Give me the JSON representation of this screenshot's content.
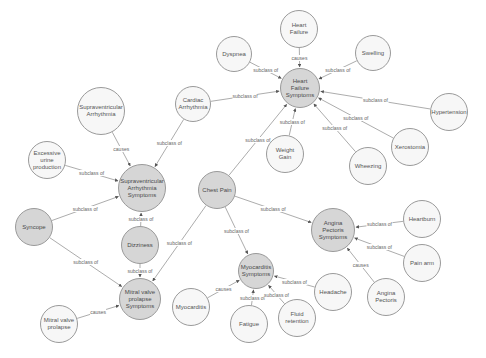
{
  "diagram": {
    "type": "ontology-graph",
    "colors": {
      "class_node": "#d6d6d6",
      "instance_node": "#f7f7f7",
      "edge": "#888888",
      "border": "#9a9a9a"
    },
    "nodes": [
      {
        "id": "hf",
        "label": "Heart Failure",
        "x": 299,
        "y": 29,
        "r": 19,
        "style": "white"
      },
      {
        "id": "dys",
        "label": "Dyspnea",
        "x": 234,
        "y": 54,
        "r": 18,
        "style": "white"
      },
      {
        "id": "swe",
        "label": "Swelling",
        "x": 373,
        "y": 53,
        "r": 18,
        "style": "white"
      },
      {
        "id": "hfs",
        "label": "Heart Failure Symptoms",
        "x": 300,
        "y": 88,
        "r": 20,
        "style": "grey"
      },
      {
        "id": "hyp",
        "label": "Hypertension",
        "x": 449,
        "y": 112,
        "r": 19,
        "style": "white"
      },
      {
        "id": "ca",
        "label": "Cardiac Arrhythmia",
        "x": 193,
        "y": 104,
        "r": 18,
        "style": "white"
      },
      {
        "id": "sa",
        "label": "Supraventricular Arrhythmia",
        "x": 101,
        "y": 111,
        "r": 24,
        "style": "white"
      },
      {
        "id": "eup",
        "label": "Excessive urine production",
        "x": 47,
        "y": 160,
        "r": 19,
        "style": "white"
      },
      {
        "id": "sas",
        "label": "Supraventricular Arrhythmia Symptoms",
        "x": 142,
        "y": 188,
        "r": 24,
        "style": "grey"
      },
      {
        "id": "xer",
        "label": "Xerostomia",
        "x": 410,
        "y": 147,
        "r": 19,
        "style": "white"
      },
      {
        "id": "wg",
        "label": "Weight Gain",
        "x": 285,
        "y": 154,
        "r": 19,
        "style": "white"
      },
      {
        "id": "whe",
        "label": "Wheezing",
        "x": 368,
        "y": 166,
        "r": 19,
        "style": "white"
      },
      {
        "id": "cp",
        "label": "Chest Pain",
        "x": 217,
        "y": 190,
        "r": 19,
        "style": "grey"
      },
      {
        "id": "syn",
        "label": "Syncope",
        "x": 34,
        "y": 227,
        "r": 19,
        "style": "grey"
      },
      {
        "id": "diz",
        "label": "Dizziness",
        "x": 140,
        "y": 245,
        "r": 19,
        "style": "grey"
      },
      {
        "id": "aps",
        "label": "Angina Pectoris Symptoms",
        "x": 333,
        "y": 230,
        "r": 22,
        "style": "grey"
      },
      {
        "id": "hb",
        "label": "Heartburn",
        "x": 422,
        "y": 219,
        "r": 19,
        "style": "white"
      },
      {
        "id": "pa",
        "label": "Pain arm",
        "x": 422,
        "y": 263,
        "r": 19,
        "style": "white"
      },
      {
        "id": "mvps",
        "label": "Mitral valve prolapse Symptoms",
        "x": 140,
        "y": 299,
        "r": 21,
        "style": "grey"
      },
      {
        "id": "ms",
        "label": "Myocarditis Symptoms",
        "x": 256,
        "y": 271,
        "r": 18,
        "style": "grey"
      },
      {
        "id": "ha",
        "label": "Headache",
        "x": 333,
        "y": 292,
        "r": 19,
        "style": "white"
      },
      {
        "id": "ap",
        "label": "Angina Pectoris",
        "x": 386,
        "y": 297,
        "r": 19,
        "style": "white"
      },
      {
        "id": "myo",
        "label": "Myocarditis",
        "x": 191,
        "y": 307,
        "r": 19,
        "style": "white"
      },
      {
        "id": "fat",
        "label": "Fatigue",
        "x": 249,
        "y": 324,
        "r": 19,
        "style": "white"
      },
      {
        "id": "fr",
        "label": "Fluid retention",
        "x": 297,
        "y": 318,
        "r": 19,
        "style": "white"
      },
      {
        "id": "mvp",
        "label": "Mitral valve prolapse",
        "x": 59,
        "y": 324,
        "r": 19,
        "style": "white"
      }
    ],
    "edges": [
      {
        "from": "hf",
        "to": "hfs",
        "label": "causes"
      },
      {
        "from": "dys",
        "to": "hfs",
        "label": "subclass of"
      },
      {
        "from": "swe",
        "to": "hfs",
        "label": "subclass of"
      },
      {
        "from": "hyp",
        "to": "hfs",
        "label": "subclass of"
      },
      {
        "from": "ca",
        "to": "hfs",
        "label": "subclass of"
      },
      {
        "from": "xer",
        "to": "hfs",
        "label": "subclass of"
      },
      {
        "from": "wg",
        "to": "hfs",
        "label": "subclass of"
      },
      {
        "from": "whe",
        "to": "hfs",
        "label": "subclass of"
      },
      {
        "from": "cp",
        "to": "hfs",
        "label": "subclass of"
      },
      {
        "from": "sa",
        "to": "sas",
        "label": "causes"
      },
      {
        "from": "ca",
        "to": "sas",
        "label": "subclass of"
      },
      {
        "from": "eup",
        "to": "sas",
        "label": "subclass of"
      },
      {
        "from": "syn",
        "to": "sas",
        "label": "subclass of"
      },
      {
        "from": "diz",
        "to": "sas",
        "label": "subclass of"
      },
      {
        "from": "syn",
        "to": "mvps",
        "label": "subclass of"
      },
      {
        "from": "diz",
        "to": "mvps",
        "label": "subclass of"
      },
      {
        "from": "cp",
        "to": "mvps",
        "label": "subclass of"
      },
      {
        "from": "mvp",
        "to": "mvps",
        "label": "causes"
      },
      {
        "from": "cp",
        "to": "aps",
        "label": "subclass of"
      },
      {
        "from": "cp",
        "to": "ms",
        "label": "subclass of"
      },
      {
        "from": "hb",
        "to": "aps",
        "label": "subclass of"
      },
      {
        "from": "pa",
        "to": "aps",
        "label": "subclass of"
      },
      {
        "from": "ap",
        "to": "aps",
        "label": "causes"
      },
      {
        "from": "myo",
        "to": "ms",
        "label": "causes"
      },
      {
        "from": "fat",
        "to": "ms",
        "label": "subclass of"
      },
      {
        "from": "fr",
        "to": "ms",
        "label": "subclass of"
      },
      {
        "from": "ha",
        "to": "ms",
        "label": "subclass of"
      }
    ]
  }
}
